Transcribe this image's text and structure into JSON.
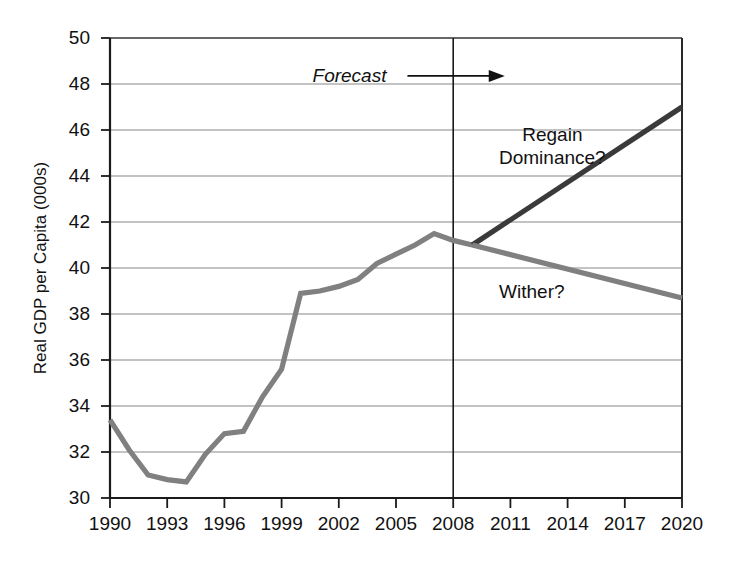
{
  "chart_data": {
    "type": "line",
    "title": "",
    "xlabel": "",
    "ylabel": "Real GDP per Capita (000s)",
    "xlim": [
      1990,
      2020
    ],
    "ylim": [
      30,
      50
    ],
    "ytick_labels": [
      "30",
      "32",
      "34",
      "36",
      "38",
      "40",
      "42",
      "44",
      "46",
      "48",
      "50"
    ],
    "ytick_values": [
      30,
      32,
      34,
      36,
      38,
      40,
      42,
      44,
      46,
      48,
      50
    ],
    "xtick_labels": [
      "1990",
      "1993",
      "1996",
      "1999",
      "2002",
      "2005",
      "2008",
      "2011",
      "2014",
      "2017",
      "2020"
    ],
    "xtick_values": [
      1990,
      1993,
      1996,
      1999,
      2002,
      2005,
      2008,
      2011,
      2014,
      2017,
      2020
    ],
    "grid": "horizontal",
    "legend": "none",
    "annotations": [
      {
        "name": "forecast",
        "text": "Forecast",
        "style": "italic",
        "x": 2004.4,
        "y": 48.3
      },
      {
        "name": "regain-dominance",
        "text": "Regain\nDominance?",
        "x": 2013.2,
        "y": 45.3
      },
      {
        "name": "wither",
        "text": "Wither?",
        "x": 2012.4,
        "y": 38.9
      }
    ],
    "forecast_divider_x": 2008,
    "series": [
      {
        "name": "Historical Real GDP per Capita",
        "color": "#808080",
        "style": "solid",
        "x": [
          1990,
          1991,
          1992,
          1993,
          1994,
          1995,
          1996,
          1997,
          1998,
          1999,
          2000,
          2001,
          2002,
          2003,
          2004,
          2005,
          2006,
          2007,
          2008,
          2009
        ],
        "values": [
          33.4,
          32.1,
          31.0,
          30.8,
          30.7,
          31.9,
          32.8,
          32.9,
          34.4,
          35.6,
          38.9,
          39.0,
          39.2,
          39.5,
          40.2,
          40.6,
          41.0,
          41.5,
          41.2,
          41.0
        ]
      },
      {
        "name": "Regain Dominance?",
        "color": "#3a3a3a",
        "style": "solid",
        "x": [
          2009,
          2020
        ],
        "values": [
          41.0,
          47.0
        ]
      },
      {
        "name": "Wither?",
        "color": "#808080",
        "style": "solid",
        "x": [
          2009,
          2020
        ],
        "values": [
          41.0,
          38.7
        ]
      }
    ]
  },
  "caption": {
    "text": "to joining us in 2020. Which way?"
  },
  "colors": {
    "axis": "#1a1a1a",
    "grid": "#888888",
    "historical_line": "#808080",
    "regain_line": "#3a3a3a",
    "wither_line": "#808080",
    "text": "#111111"
  }
}
